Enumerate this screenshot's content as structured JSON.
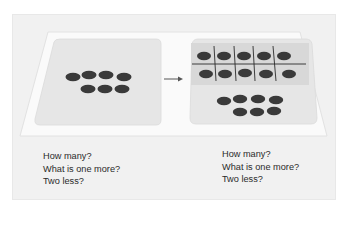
{
  "diagram": {
    "colors": {
      "background": "#ffffff",
      "outer_panel": "#f1f1f1",
      "mat": "#fafafa",
      "card": "#e6e6e6",
      "ten_frame": "#dcdcdc",
      "counter": "#3a3a3a",
      "grid_line": "#2b2b2b",
      "arrow": "#555555"
    },
    "left_card": {
      "label": "scattered counters",
      "counter_count": 7,
      "rows": [
        4,
        3
      ]
    },
    "arrow": {
      "icon": "right-arrow-icon"
    },
    "right_card": {
      "label": "ten-frame plus counters",
      "ten_frame": {
        "columns": 5,
        "rows": 2,
        "filled": 10
      },
      "extra_counters": {
        "count": 7,
        "rows": [
          4,
          3
        ]
      }
    },
    "left_questions": [
      "How many?",
      "What is one more?",
      "Two less?"
    ],
    "right_questions": [
      "How many?",
      "What is one more?",
      "Two less?"
    ]
  }
}
